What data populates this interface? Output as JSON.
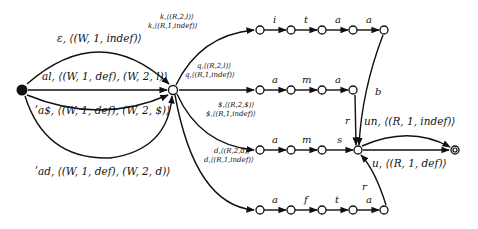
{
  "diagram": {
    "type": "finite-state-automaton",
    "nodes": {
      "start": {
        "x": 22,
        "y": 90
      },
      "hub": {
        "x": 173,
        "y": 90
      },
      "final": {
        "x": 455,
        "y": 150
      },
      "row1": [
        {
          "x": 260,
          "y": 30
        },
        {
          "x": 291,
          "y": 30
        },
        {
          "x": 322,
          "y": 30
        },
        {
          "x": 353,
          "y": 30
        },
        {
          "x": 384,
          "y": 30
        }
      ],
      "row2": [
        {
          "x": 260,
          "y": 90
        },
        {
          "x": 291,
          "y": 90
        },
        {
          "x": 322,
          "y": 90
        },
        {
          "x": 353,
          "y": 90
        }
      ],
      "row3": [
        {
          "x": 260,
          "y": 150
        },
        {
          "x": 291,
          "y": 150
        },
        {
          "x": 322,
          "y": 150
        },
        {
          "x": 358,
          "y": 150
        }
      ],
      "row4": [
        {
          "x": 260,
          "y": 210
        },
        {
          "x": 291,
          "y": 210
        },
        {
          "x": 322,
          "y": 210
        },
        {
          "x": 353,
          "y": 210
        },
        {
          "x": 384,
          "y": 210
        }
      ]
    },
    "start_edges": {
      "epsilon": "ε, ⟨(W, 1, indef)⟩",
      "al": "al, ⟨(W, 1, def), (W, 2, l)⟩",
      "a_dollar": "ʹa$, ⟨(W, 1, def), (W, 2, $)⟩",
      "ad": "ʹad, ⟨(W, 1, def), (W, 2, d)⟩"
    },
    "hub_edges": {
      "k": [
        "k,⟨(R,2,l)⟩",
        "k,⟨(R,1,indef)⟩"
      ],
      "q": [
        "q,⟨(R,2,l)⟩",
        "q,⟨(R,1,indef)⟩"
      ],
      "dollar": [
        "$,⟨(R,2,$)⟩",
        "$,⟨(R,1,indef)⟩"
      ],
      "d": [
        "d,⟨(R,2,d)⟩",
        "d,⟨(R,1,indef)⟩"
      ]
    },
    "row_labels": {
      "row1": [
        "i",
        "t",
        "a",
        "a"
      ],
      "row2": [
        "a",
        "m",
        "a"
      ],
      "row3": [
        "a",
        "m",
        "s"
      ],
      "row4": [
        "a",
        "f",
        "t",
        "a"
      ]
    },
    "merge_labels": {
      "row1_to_merge": "b",
      "row2_to_merge": "r",
      "row4_to_merge": "r"
    },
    "final_edges": {
      "upper": "un, ⟨(R, 1, indef)⟩",
      "lower": "u, ⟨(R, 1, def)⟩"
    }
  }
}
